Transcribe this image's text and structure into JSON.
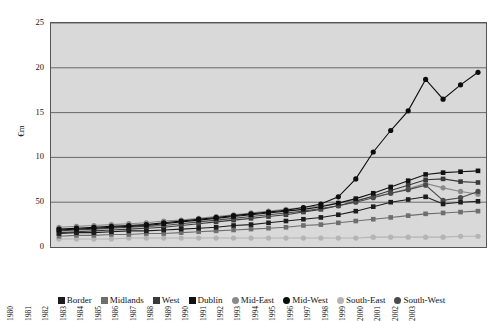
{
  "axis": {
    "ylabel": "€m",
    "yticks": [
      "0",
      "50",
      "10",
      "15",
      "20",
      "25"
    ],
    "ytick_values": [
      0,
      5,
      10,
      15,
      20,
      25
    ],
    "ylim": [
      0,
      25
    ],
    "xticks": [
      "1979",
      "1980",
      "1981",
      "1982",
      "1983",
      "1984",
      "1985",
      "1986",
      "1987",
      "1988",
      "1989",
      "1990",
      "1991",
      "1992",
      "1993",
      "1994",
      "1995",
      "1996",
      "1997",
      "1998",
      "1999",
      "2000",
      "2001",
      "2002",
      "2003"
    ]
  },
  "legend": [
    {
      "label": "Border",
      "marker": "square",
      "color": "#1c1c1c"
    },
    {
      "label": "Midlands",
      "marker": "square",
      "color": "#6e6e6e"
    },
    {
      "label": "West",
      "marker": "square",
      "color": "#3a3a3a"
    },
    {
      "label": "Dublin",
      "marker": "square",
      "color": "#111111"
    },
    {
      "label": "Mid-East",
      "marker": "circle",
      "color": "#8a8a8a"
    },
    {
      "label": "Mid-West",
      "marker": "circle",
      "color": "#0d0d0d"
    },
    {
      "label": "South-East",
      "marker": "circle",
      "color": "#b4b4b4"
    },
    {
      "label": "South-West",
      "marker": "circle",
      "color": "#4a4a4a"
    }
  ],
  "chart_data": {
    "type": "line",
    "title": "",
    "xlabel": "",
    "ylabel": "€m",
    "ylim": [
      0,
      25
    ],
    "grid": "horizontal",
    "legend_position": "bottom",
    "categories": [
      "1979",
      "1980",
      "1981",
      "1982",
      "1983",
      "1984",
      "1985",
      "1986",
      "1987",
      "1988",
      "1989",
      "1990",
      "1991",
      "1992",
      "1993",
      "1994",
      "1995",
      "1996",
      "1997",
      "1998",
      "1999",
      "2000",
      "2001",
      "2002",
      "2003"
    ],
    "series": [
      {
        "name": "Border",
        "marker": "square",
        "color": "#1c1c1c",
        "values": [
          1.5,
          1.6,
          1.6,
          1.7,
          1.8,
          1.8,
          1.9,
          2.0,
          2.1,
          2.2,
          2.4,
          2.5,
          2.7,
          2.9,
          3.1,
          3.3,
          3.6,
          4.0,
          4.5,
          5.0,
          5.3,
          5.6,
          4.8,
          5.0,
          5.1
        ]
      },
      {
        "name": "Midlands",
        "marker": "square",
        "color": "#6e6e6e",
        "values": [
          1.2,
          1.3,
          1.3,
          1.4,
          1.4,
          1.5,
          1.5,
          1.6,
          1.7,
          1.8,
          1.9,
          2.0,
          2.1,
          2.2,
          2.4,
          2.5,
          2.7,
          2.9,
          3.1,
          3.3,
          3.5,
          3.7,
          3.8,
          3.9,
          4.0
        ]
      },
      {
        "name": "West",
        "marker": "square",
        "color": "#3a3a3a",
        "values": [
          1.6,
          1.7,
          1.8,
          1.9,
          2.0,
          2.1,
          2.2,
          2.4,
          2.6,
          2.8,
          3.0,
          3.2,
          3.4,
          3.6,
          3.9,
          4.2,
          4.6,
          5.1,
          5.7,
          6.3,
          6.9,
          7.5,
          7.6,
          7.3,
          7.2
        ]
      },
      {
        "name": "Dublin",
        "marker": "square",
        "color": "#111111",
        "values": [
          1.9,
          2.0,
          2.1,
          2.2,
          2.3,
          2.4,
          2.6,
          2.8,
          3.0,
          3.2,
          3.4,
          3.6,
          3.8,
          4.0,
          4.2,
          4.5,
          4.9,
          5.4,
          6.0,
          6.7,
          7.4,
          8.1,
          8.3,
          8.4,
          8.5
        ]
      },
      {
        "name": "Mid-East",
        "marker": "circle",
        "color": "#8a8a8a",
        "values": [
          2.2,
          2.3,
          2.4,
          2.5,
          2.6,
          2.7,
          2.9,
          3.0,
          3.2,
          3.4,
          3.6,
          3.8,
          4.0,
          4.2,
          4.4,
          4.6,
          4.9,
          5.2,
          5.6,
          6.0,
          6.5,
          7.1,
          6.6,
          6.2,
          5.9
        ]
      },
      {
        "name": "Mid-West",
        "marker": "circle",
        "color": "#0d0d0d",
        "values": [
          2.0,
          2.1,
          2.2,
          2.3,
          2.4,
          2.5,
          2.7,
          2.9,
          3.1,
          3.3,
          3.5,
          3.7,
          3.9,
          4.1,
          4.4,
          4.8,
          5.6,
          7.6,
          10.6,
          13.0,
          15.2,
          18.7,
          16.5,
          18.1,
          19.5
        ]
      },
      {
        "name": "South-East",
        "marker": "circle",
        "color": "#b4b4b4",
        "values": [
          0.9,
          0.9,
          0.9,
          0.9,
          1.0,
          1.0,
          1.0,
          1.0,
          1.0,
          1.0,
          1.0,
          1.0,
          1.0,
          1.0,
          1.0,
          1.0,
          1.0,
          1.0,
          1.1,
          1.1,
          1.1,
          1.1,
          1.1,
          1.2,
          1.2
        ]
      },
      {
        "name": "South-West",
        "marker": "circle",
        "color": "#4a4a4a",
        "values": [
          1.8,
          1.9,
          2.0,
          2.1,
          2.2,
          2.3,
          2.4,
          2.6,
          2.8,
          3.0,
          3.2,
          3.4,
          3.6,
          3.8,
          4.0,
          4.3,
          4.6,
          5.0,
          5.5,
          6.0,
          6.4,
          6.9,
          5.2,
          5.5,
          6.2
        ]
      }
    ]
  }
}
